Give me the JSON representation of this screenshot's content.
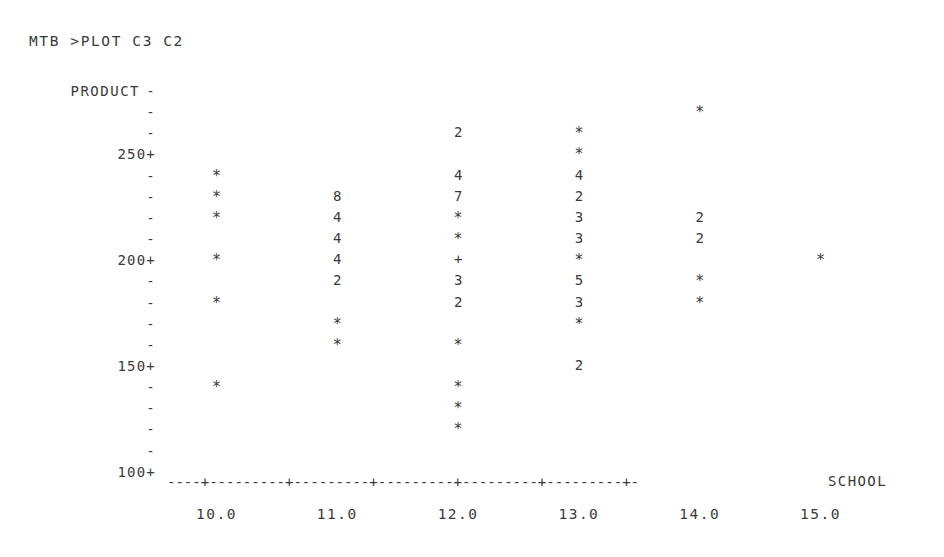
{
  "terminal": {
    "prompt_line": "MTB >PLOT C3 C2"
  },
  "chart_data": {
    "type": "scatter",
    "title": "MTB >PLOT C3 C2",
    "ylabel": "PRODUCT",
    "xlabel": "SCHOOL",
    "xlim": [
      9.5,
      15.5
    ],
    "ylim": [
      100,
      275
    ],
    "grid": false,
    "legend": null,
    "x_ticks": [
      "10.0",
      "11.0",
      "12.0",
      "13.0",
      "14.0",
      "15.0"
    ],
    "x_tick_values": [
      10.0,
      11.0,
      12.0,
      13.0,
      14.0,
      15.0
    ],
    "y_ticks": [
      "250+",
      "200+",
      "150+",
      "100+"
    ],
    "y_tick_values": [
      250,
      200,
      150,
      100
    ],
    "y_row_step": 10,
    "rows": [
      {
        "y": 275,
        "tick": "-",
        "tick_label": "",
        "cells": []
      },
      {
        "y": 270,
        "tick": "-",
        "tick_label": "",
        "cells": [
          {
            "x": 14.0,
            "mark": "*",
            "count": 1
          }
        ]
      },
      {
        "y": 260,
        "tick": "-",
        "tick_label": "",
        "cells": [
          {
            "x": 12.0,
            "mark": "2",
            "count": 2
          },
          {
            "x": 13.0,
            "mark": "*",
            "count": 1
          }
        ]
      },
      {
        "y": 250,
        "tick": "+",
        "tick_label": "250+",
        "cells": [
          {
            "x": 13.0,
            "mark": "*",
            "count": 1
          }
        ]
      },
      {
        "y": 240,
        "tick": "-",
        "tick_label": "",
        "cells": [
          {
            "x": 10.0,
            "mark": "*",
            "count": 1
          },
          {
            "x": 12.0,
            "mark": "4",
            "count": 4
          },
          {
            "x": 13.0,
            "mark": "4",
            "count": 4
          }
        ]
      },
      {
        "y": 230,
        "tick": "-",
        "tick_label": "",
        "cells": [
          {
            "x": 10.0,
            "mark": "*",
            "count": 1
          },
          {
            "x": 11.0,
            "mark": "8",
            "count": 8
          },
          {
            "x": 12.0,
            "mark": "7",
            "count": 7
          },
          {
            "x": 13.0,
            "mark": "2",
            "count": 2
          }
        ]
      },
      {
        "y": 220,
        "tick": "-",
        "tick_label": "",
        "cells": [
          {
            "x": 10.0,
            "mark": "*",
            "count": 1
          },
          {
            "x": 11.0,
            "mark": "4",
            "count": 4
          },
          {
            "x": 12.0,
            "mark": "*",
            "count": 1
          },
          {
            "x": 13.0,
            "mark": "3",
            "count": 3
          },
          {
            "x": 14.0,
            "mark": "2",
            "count": 2
          }
        ]
      },
      {
        "y": 210,
        "tick": "-",
        "tick_label": "",
        "cells": [
          {
            "x": 11.0,
            "mark": "4",
            "count": 4
          },
          {
            "x": 12.0,
            "mark": "*",
            "count": 1
          },
          {
            "x": 13.0,
            "mark": "3",
            "count": 3
          },
          {
            "x": 14.0,
            "mark": "2",
            "count": 2
          }
        ]
      },
      {
        "y": 200,
        "tick": "+",
        "tick_label": "200+",
        "cells": [
          {
            "x": 10.0,
            "mark": "*",
            "count": 1
          },
          {
            "x": 11.0,
            "mark": "4",
            "count": 4
          },
          {
            "x": 12.0,
            "mark": "+",
            "count": 10
          },
          {
            "x": 13.0,
            "mark": "*",
            "count": 1
          },
          {
            "x": 15.0,
            "mark": "*",
            "count": 1
          }
        ]
      },
      {
        "y": 190,
        "tick": "-",
        "tick_label": "",
        "cells": [
          {
            "x": 11.0,
            "mark": "2",
            "count": 2
          },
          {
            "x": 12.0,
            "mark": "3",
            "count": 3
          },
          {
            "x": 13.0,
            "mark": "5",
            "count": 5
          },
          {
            "x": 14.0,
            "mark": "*",
            "count": 1
          }
        ]
      },
      {
        "y": 180,
        "tick": "-",
        "tick_label": "",
        "cells": [
          {
            "x": 10.0,
            "mark": "*",
            "count": 1
          },
          {
            "x": 12.0,
            "mark": "2",
            "count": 2
          },
          {
            "x": 13.0,
            "mark": "3",
            "count": 3
          },
          {
            "x": 14.0,
            "mark": "*",
            "count": 1
          }
        ]
      },
      {
        "y": 170,
        "tick": "-",
        "tick_label": "",
        "cells": [
          {
            "x": 11.0,
            "mark": "*",
            "count": 1
          },
          {
            "x": 13.0,
            "mark": "*",
            "count": 1
          }
        ]
      },
      {
        "y": 160,
        "tick": "-",
        "tick_label": "",
        "cells": [
          {
            "x": 11.0,
            "mark": "*",
            "count": 1
          },
          {
            "x": 12.0,
            "mark": "*",
            "count": 1
          }
        ]
      },
      {
        "y": 150,
        "tick": "+",
        "tick_label": "150+",
        "cells": [
          {
            "x": 13.0,
            "mark": "2",
            "count": 2
          }
        ]
      },
      {
        "y": 140,
        "tick": "-",
        "tick_label": "",
        "cells": [
          {
            "x": 10.0,
            "mark": "*",
            "count": 1
          },
          {
            "x": 12.0,
            "mark": "*",
            "count": 1
          }
        ]
      },
      {
        "y": 130,
        "tick": "-",
        "tick_label": "",
        "cells": [
          {
            "x": 12.0,
            "mark": "*",
            "count": 1
          }
        ]
      },
      {
        "y": 120,
        "tick": "-",
        "tick_label": "",
        "cells": [
          {
            "x": 12.0,
            "mark": "*",
            "count": 1
          }
        ]
      },
      {
        "y": 110,
        "tick": "-",
        "tick_label": "",
        "cells": []
      },
      {
        "y": 100,
        "tick": "+",
        "tick_label": "100+",
        "cells": []
      }
    ],
    "axis_line": "----+---------+---------+---------+---------+---------+-"
  }
}
